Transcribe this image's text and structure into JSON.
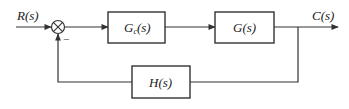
{
  "diagram": {
    "type": "closed-loop block diagram",
    "input_label": "R(s)",
    "output_label": "C(s)",
    "summing_junction": {
      "symbol": "⊗",
      "feedback_sign": "−"
    },
    "blocks": [
      {
        "id": "controller",
        "label_main": "G",
        "label_sub": "c",
        "label_tail": "(s)"
      },
      {
        "id": "plant",
        "label": "G(s)"
      },
      {
        "id": "feedback",
        "label": "H(s)"
      }
    ],
    "colors": {
      "line": "#333333",
      "background": "#ffffff"
    }
  }
}
